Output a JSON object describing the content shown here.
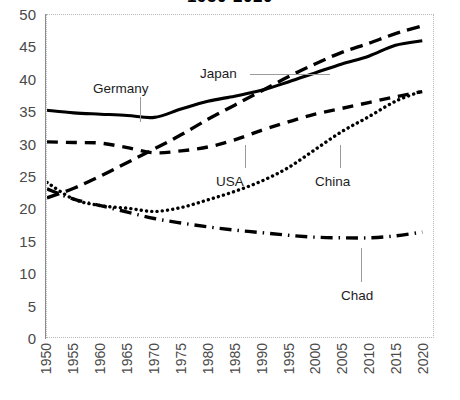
{
  "chart_data": {
    "type": "line",
    "title": "1950-2020",
    "xlabel": "",
    "ylabel": "",
    "x": [
      1950,
      1955,
      1960,
      1965,
      1970,
      1975,
      1980,
      1985,
      1990,
      1995,
      2000,
      2005,
      2010,
      2015,
      2020
    ],
    "categories": [
      "1950",
      "1955",
      "1960",
      "1965",
      "1970",
      "1975",
      "1980",
      "1985",
      "1990",
      "1995",
      "2000",
      "2005",
      "2010",
      "2015",
      "2020"
    ],
    "xlim": [
      1950,
      2022
    ],
    "ylim": [
      0,
      50
    ],
    "yticks": [
      0,
      5,
      10,
      15,
      20,
      25,
      30,
      35,
      40,
      45,
      50
    ],
    "grid": false,
    "legend_position": "in-plot-labels-with-leader-lines",
    "series": [
      {
        "name": "Germany",
        "style": "solid",
        "values": [
          35.2,
          34.8,
          34.6,
          34.4,
          34.1,
          35.4,
          36.6,
          37.4,
          38.3,
          39.6,
          41.0,
          42.4,
          43.6,
          45.3,
          46.0
        ]
      },
      {
        "name": "Japan",
        "style": "long-dash",
        "values": [
          21.6,
          23.1,
          25.0,
          27.1,
          29.2,
          31.4,
          33.8,
          36.0,
          38.2,
          40.4,
          42.4,
          44.2,
          45.6,
          47.1,
          48.3
        ]
      },
      {
        "name": "USA",
        "style": "dash",
        "values": [
          30.3,
          30.2,
          30.1,
          29.4,
          28.6,
          28.9,
          29.5,
          30.6,
          32.1,
          33.4,
          34.6,
          35.5,
          36.4,
          37.3,
          38.1
        ]
      },
      {
        "name": "China",
        "style": "dotted",
        "values": [
          24.0,
          21.4,
          20.4,
          20.0,
          19.5,
          20.1,
          21.3,
          22.6,
          24.2,
          26.3,
          29.1,
          31.9,
          34.2,
          36.6,
          38.2
        ]
      },
      {
        "name": "Chad",
        "style": "dash-dot",
        "values": [
          23.0,
          21.4,
          20.4,
          19.4,
          18.4,
          17.7,
          17.1,
          16.6,
          16.2,
          15.8,
          15.5,
          15.4,
          15.4,
          15.7,
          16.3
        ]
      }
    ],
    "annotations": [
      {
        "label": "Germany",
        "target_series": "Germany",
        "leader": "vertical-up"
      },
      {
        "label": "Japan",
        "target_series": "Japan",
        "leader": "horizontal-right"
      },
      {
        "label": "USA",
        "target_series": "USA",
        "leader": "vertical-up"
      },
      {
        "label": "China",
        "target_series": "China",
        "leader": "vertical-up"
      },
      {
        "label": "Chad",
        "target_series": "Chad",
        "leader": "vertical-up"
      }
    ]
  },
  "labels": {
    "germany": "Germany",
    "japan": "Japan",
    "usa": "USA",
    "china": "China",
    "chad": "Chad"
  },
  "colors": {
    "line": "#000000",
    "axis": "#8c8c8c",
    "frame": "#b9b9b9",
    "tick_text": "#4a4a4a",
    "leader": "#9b9b9b",
    "background": "#ffffff"
  }
}
